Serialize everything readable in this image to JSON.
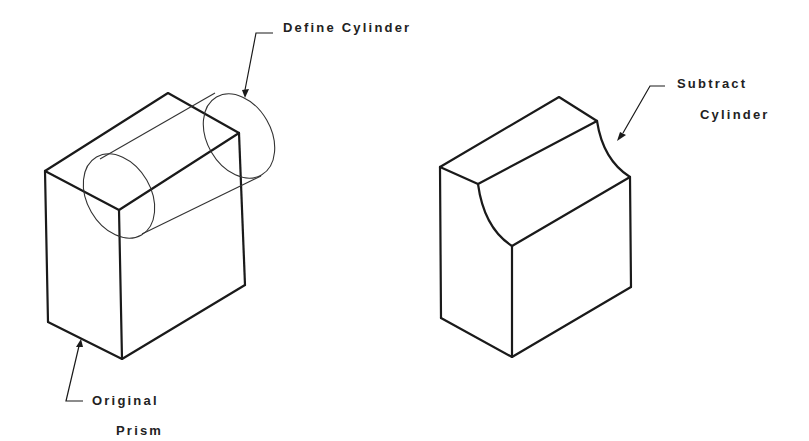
{
  "diagram": {
    "type": "solid-modeling boolean operation (isometric)",
    "colors": {
      "ink": "#1a1a1a",
      "background": "#ffffff",
      "text": "#222222"
    },
    "left_figure": {
      "description": "Rectangular prism with a cylinder defined through its top-front edge",
      "labels": {
        "define_cylinder": "Define Cylinder",
        "original_prism_line1": "Original",
        "original_prism_line2": "Prism"
      }
    },
    "right_figure": {
      "description": "Prism with cylinder subtracted, leaving a concave quarter-round cut along the top edge",
      "labels": {
        "subtract_line1": "Subtract",
        "subtract_line2": "Cylinder"
      }
    }
  }
}
